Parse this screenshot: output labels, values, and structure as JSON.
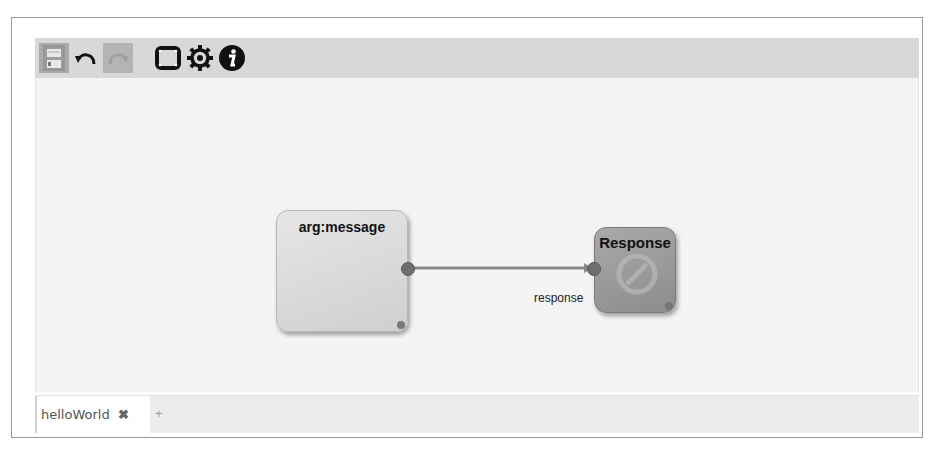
{
  "toolbar": {
    "buttons": [
      {
        "name": "save",
        "icon": "save-icon",
        "state": "disabled"
      },
      {
        "name": "undo",
        "icon": "undo-icon",
        "state": "enabled"
      },
      {
        "name": "redo",
        "icon": "redo-icon",
        "state": "disabled"
      },
      {
        "name": "fullscreen",
        "icon": "fullscreen-icon",
        "state": "enabled"
      },
      {
        "name": "settings",
        "icon": "gear-icon",
        "state": "enabled"
      },
      {
        "name": "info",
        "icon": "info-icon",
        "state": "enabled"
      }
    ]
  },
  "canvas": {
    "nodes": [
      {
        "id": "arg",
        "title": "arg:message"
      },
      {
        "id": "response",
        "title": "Response"
      }
    ],
    "edges": [
      {
        "from": "arg",
        "to": "response",
        "label": "response"
      }
    ]
  },
  "tabs": {
    "items": [
      {
        "label": "helloWorld",
        "close": "✖"
      }
    ],
    "add_label": "+"
  },
  "colors": {
    "toolbar_bg": "#d8d8d8",
    "canvas_bg": "#f4f4f4",
    "edge": "#8a8a8a"
  }
}
